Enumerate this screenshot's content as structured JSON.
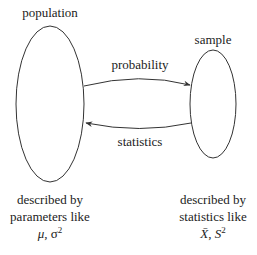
{
  "diagram": {
    "nodes": [
      {
        "id": "population",
        "label": "population",
        "shape": "ellipse",
        "description_lines": [
          "described by",
          "parameters like"
        ],
        "symbols": {
          "mu": "μ",
          "sep": ", ",
          "sigma": "σ",
          "exp": "2"
        }
      },
      {
        "id": "sample",
        "label": "sample",
        "shape": "ellipse",
        "description_lines": [
          "described by",
          "statistics like"
        ],
        "symbols": {
          "xbar": "X̄",
          "sep": ", ",
          "s": "S",
          "exp": "2"
        }
      }
    ],
    "edges": [
      {
        "from": "population",
        "to": "sample",
        "label": "probability",
        "arrow": "to-sample"
      },
      {
        "from": "sample",
        "to": "population",
        "label": "statistics",
        "arrow": "to-population"
      }
    ],
    "colors": {
      "stroke": "#333333",
      "text": "#222222",
      "background": "#ffffff"
    }
  }
}
